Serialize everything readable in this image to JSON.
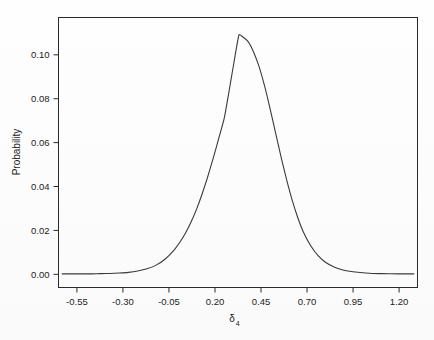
{
  "chart_data": {
    "type": "line",
    "title": "",
    "subtitle": "",
    "xlabel": "δ",
    "xlabel_sub": "4",
    "ylabel": "Probability",
    "xlim": [
      -0.65,
      1.3
    ],
    "ylim": [
      -0.006,
      0.117
    ],
    "grid": false,
    "legend": null,
    "x_ticks": [
      "-0.55",
      "-0.30",
      "-0.05",
      "0.20",
      "0.45",
      "0.70",
      "0.95",
      "1.20"
    ],
    "x_tick_values": [
      -0.55,
      -0.3,
      -0.05,
      0.2,
      0.45,
      0.7,
      0.95,
      1.2
    ],
    "y_ticks": [
      "0.00",
      "0.02",
      "0.04",
      "0.06",
      "0.08",
      "0.10"
    ],
    "y_tick_values": [
      0.0,
      0.02,
      0.04,
      0.06,
      0.08,
      0.1
    ],
    "series": [
      {
        "name": "posterior density",
        "x": [
          -0.52,
          -0.47,
          -0.42,
          -0.37,
          -0.32,
          -0.27,
          -0.22,
          -0.17,
          -0.12,
          -0.07,
          -0.02,
          0.01,
          0.04,
          0.07,
          0.1,
          0.13,
          0.16,
          0.19,
          0.22,
          0.25,
          0.28,
          0.31,
          0.33,
          0.35,
          0.38,
          0.41,
          0.44,
          0.47,
          0.5,
          0.53,
          0.56,
          0.59,
          0.62,
          0.65,
          0.68,
          0.72,
          0.76,
          0.8,
          0.85,
          0.9,
          0.95,
          1.02,
          1.1,
          1.2
        ],
        "values": [
          0.0002,
          0.0002,
          0.0003,
          0.0004,
          0.0006,
          0.0009,
          0.0015,
          0.0025,
          0.0042,
          0.007,
          0.0113,
          0.0147,
          0.0188,
          0.0238,
          0.0297,
          0.0366,
          0.0443,
          0.0528,
          0.0618,
          0.071,
          0.0852,
          0.1,
          0.109,
          0.1082,
          0.106,
          0.1012,
          0.0945,
          0.0856,
          0.0752,
          0.0641,
          0.0531,
          0.0428,
          0.0336,
          0.0258,
          0.0193,
          0.013,
          0.0085,
          0.0055,
          0.0032,
          0.0019,
          0.0012,
          0.0006,
          0.0003,
          0.0002
        ],
        "peak_x": 0.33,
        "peak_y": 0.109
      }
    ]
  }
}
